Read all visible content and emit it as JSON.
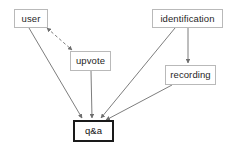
{
  "diagram": {
    "background_color": "#ffffff",
    "node_border_color": "#b9b9b9",
    "node_emphasis_border_color": "#1a1a1a",
    "edge_color": "#6e6e6e",
    "text_color": "#262626",
    "nodes": [
      {
        "id": "user",
        "label": "user",
        "x": 14,
        "y": 9,
        "w": 34,
        "h": 19,
        "emphasis": false
      },
      {
        "id": "upvote",
        "label": "upvote",
        "x": 70,
        "y": 51,
        "w": 41,
        "h": 20,
        "emphasis": false
      },
      {
        "id": "identification",
        "label": "identification",
        "x": 152,
        "y": 9,
        "w": 71,
        "h": 19,
        "emphasis": false
      },
      {
        "id": "recording",
        "label": "recording",
        "x": 165,
        "y": 65,
        "w": 51,
        "h": 20,
        "emphasis": false
      },
      {
        "id": "qa",
        "label": "q&a",
        "x": 73,
        "y": 120,
        "w": 41,
        "h": 22,
        "emphasis": true
      }
    ],
    "edges": [
      {
        "id": "user-upvote",
        "from": "user",
        "to": "upvote",
        "style": "dashed",
        "arrows": "both",
        "x1": 47,
        "y1": 28,
        "x2": 72,
        "y2": 50
      },
      {
        "id": "user-qa",
        "from": "user",
        "to": "qa",
        "style": "solid",
        "arrows": "end",
        "x1": 29,
        "y1": 28,
        "x2": 82,
        "y2": 118
      },
      {
        "id": "upvote-qa",
        "from": "upvote",
        "to": "qa",
        "style": "solid",
        "arrows": "end",
        "x1": 91,
        "y1": 71,
        "x2": 92,
        "y2": 118
      },
      {
        "id": "identification-recording",
        "from": "identification",
        "to": "recording",
        "style": "solid",
        "arrows": "end",
        "x1": 188,
        "y1": 28,
        "x2": 188,
        "y2": 63
      },
      {
        "id": "identification-qa",
        "from": "identification",
        "to": "qa",
        "style": "solid",
        "arrows": "end",
        "x1": 175,
        "y1": 28,
        "x2": 101,
        "y2": 118
      },
      {
        "id": "recording-qa",
        "from": "recording",
        "to": "qa",
        "style": "solid",
        "arrows": "end",
        "x1": 172,
        "y1": 85,
        "x2": 106,
        "y2": 120
      }
    ]
  }
}
